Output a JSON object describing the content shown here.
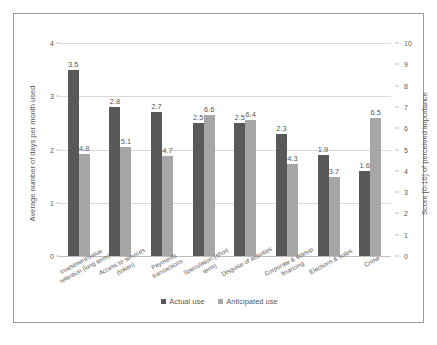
{
  "chart_data": {
    "type": "bar",
    "title": "",
    "subtitle": "",
    "xlabel": "",
    "categories": [
      "Investment/value retention (long term)",
      "Access to services (token)",
      "Payments transactions",
      "Speculation (short term)",
      "Disguise of activities",
      "Corporate & startup financing",
      "Elections & votes",
      "Crime"
    ],
    "series": [
      {
        "name": "Actual use",
        "axis": "left",
        "color": "#595959",
        "values": [
          3.5,
          2.8,
          2.7,
          2.5,
          2.5,
          2.3,
          1.9,
          1.6
        ]
      },
      {
        "name": "Anticipated use",
        "axis": "right",
        "color": "#a6a6a6",
        "values": [
          4.8,
          5.1,
          4.7,
          6.6,
          6.4,
          4.3,
          3.7,
          6.5
        ]
      }
    ],
    "left_axis": {
      "label": "Average number of days per month used",
      "ticks": [
        "0",
        "1",
        "2",
        "3",
        "4"
      ],
      "min": 0,
      "max": 4
    },
    "right_axis": {
      "label": "Score [0-10] of perceived importance",
      "ticks": [
        "0",
        "1",
        "2",
        "3",
        "4",
        "5",
        "6",
        "7",
        "8",
        "9",
        "10"
      ],
      "min": 0,
      "max": 10
    },
    "grid": true,
    "legend_position": "bottom",
    "legend": [
      "Actual use",
      "Anticipated use"
    ]
  },
  "colors": {
    "actual": "#595959",
    "anticipated": "#a6a6a6",
    "grid": "#d9d9d9",
    "axis_text": "#595959",
    "border": "#9a9a9a",
    "background": "#ffffff"
  }
}
